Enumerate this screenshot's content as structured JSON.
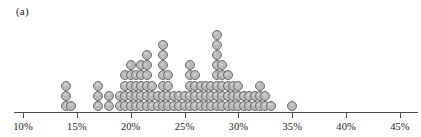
{
  "figure": {
    "panel_label": "(a)",
    "background_color": "#ffffff",
    "dot_fill_color": "#b9b9b9",
    "dot_stroke_color": "#6d6d6d",
    "axis_color": "#4a4a4a",
    "text_color": "#1a1a1a"
  },
  "axis": {
    "ticks": [
      {
        "label": "10%",
        "value": 10
      },
      {
        "label": "15%",
        "value": 15
      },
      {
        "label": "20%",
        "value": 20
      },
      {
        "label": "25%",
        "value": 25
      },
      {
        "label": "30%",
        "value": 30
      },
      {
        "label": "35%",
        "value": 35
      },
      {
        "label": "40%",
        "value": 40
      },
      {
        "label": "45%",
        "value": 45
      }
    ],
    "min": 9,
    "max": 46.5,
    "px_left": 14,
    "px_right": 418,
    "px_per_unit": 10.77,
    "origin_px": 23,
    "baseline_y": 112
  },
  "chart_data": {
    "type": "bar",
    "subtype": "dot-plot",
    "title": "(a)",
    "xlabel": "",
    "ylabel": "",
    "xlim": [
      9,
      46.5
    ],
    "grid": false,
    "legend": null,
    "dot_diameter_px": 10,
    "column_spacing_px": 10.77,
    "row_spacing_px": 10.2,
    "total_dots": 83,
    "categories": [
      "14%",
      "14.5%",
      "17%",
      "18%",
      "19%",
      "19.5%",
      "20%",
      "20.5%",
      "21%",
      "21.5%",
      "22%",
      "22.5%",
      "23%",
      "23.5%",
      "24%",
      "24.5%",
      "25%",
      "25.5%",
      "26%",
      "26.5%",
      "27%",
      "27.5%",
      "28%",
      "28.5%",
      "29%",
      "29.5%",
      "30%",
      "30.5%",
      "31%",
      "31.5%",
      "32%",
      "32.5%",
      "33%",
      "35%"
    ],
    "x": [
      14,
      14.5,
      17,
      18,
      19,
      19.5,
      20,
      20.5,
      21,
      21.5,
      22,
      22.5,
      23,
      23.5,
      24,
      24.5,
      25,
      25.5,
      26,
      26.5,
      27,
      27.5,
      28,
      28.5,
      29,
      29.5,
      30,
      30.5,
      31,
      31.5,
      32,
      32.5,
      33,
      35
    ],
    "values": [
      3,
      1,
      3,
      2,
      2,
      4,
      5,
      4,
      5,
      6,
      3,
      2,
      7,
      4,
      2,
      2,
      2,
      5,
      4,
      3,
      3,
      3,
      8,
      5,
      4,
      3,
      3,
      2,
      2,
      2,
      3,
      2,
      1,
      1
    ],
    "counts_note": "each dot represents one observation; column height equals count"
  }
}
